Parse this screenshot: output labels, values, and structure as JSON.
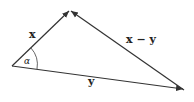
{
  "diagram": {
    "type": "vector-triangle",
    "colors": {
      "line": "#333333",
      "text": "#222222",
      "background": "#ffffff"
    },
    "points": {
      "origin": {
        "x": 12,
        "y": 66
      },
      "tip_x": {
        "x": 70,
        "y": 10
      },
      "tip_y": {
        "x": 184,
        "y": 90
      }
    },
    "vectors": [
      {
        "id": "x",
        "label": "x",
        "from": "origin",
        "to": "tip_x"
      },
      {
        "id": "y",
        "label": "y",
        "from": "origin",
        "to": "tip_y"
      },
      {
        "id": "x-y",
        "label": "x − y",
        "from": "tip_y",
        "to": "tip_x"
      }
    ],
    "angle": {
      "label": "α",
      "at": "origin"
    },
    "labels": {
      "x": "x",
      "y": "y",
      "x_minus_y": "x − y",
      "alpha": "α"
    }
  }
}
